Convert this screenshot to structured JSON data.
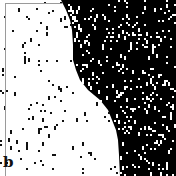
{
  "figure": {
    "panel_label": "b",
    "width": 176,
    "height": 176,
    "colors": {
      "background": "#ffffff",
      "domain_dark": "#000000",
      "dot_on_white": "#111111",
      "dot_on_black": "#ffffff",
      "frame": "#9a9a9a"
    },
    "frame": {
      "top_y": 3,
      "left_x": 5
    },
    "boundary": [
      [
        61,
        0
      ],
      [
        66,
        10
      ],
      [
        70,
        20
      ],
      [
        72,
        30
      ],
      [
        73,
        45
      ],
      [
        73,
        60
      ],
      [
        76,
        70
      ],
      [
        80,
        80
      ],
      [
        88,
        90
      ],
      [
        100,
        100
      ],
      [
        108,
        110
      ],
      [
        112,
        120
      ],
      [
        116,
        130
      ],
      [
        118,
        140
      ],
      [
        119,
        155
      ],
      [
        120,
        176
      ]
    ],
    "dot_density": {
      "white_region": 0.028,
      "black_region": 0.085
    },
    "cell_size": 2,
    "seed": 12345
  }
}
